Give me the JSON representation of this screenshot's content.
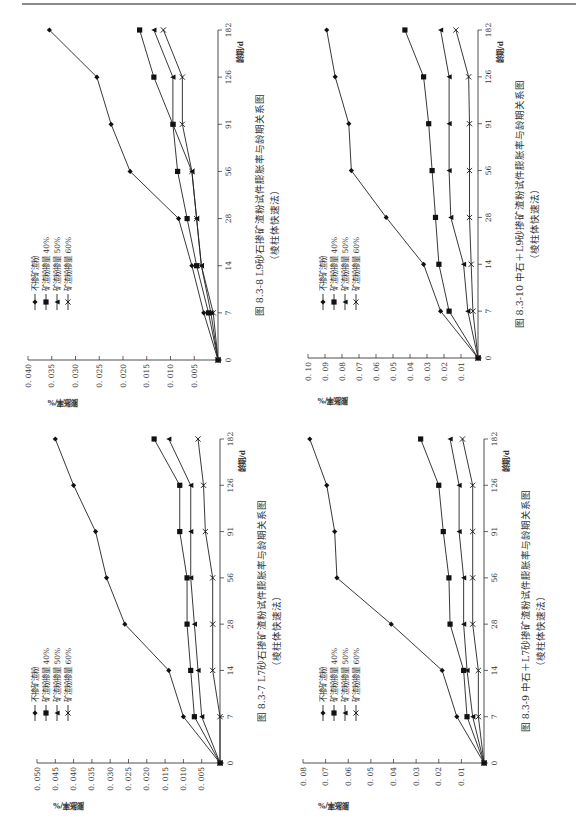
{
  "page": {
    "top_rule": true
  },
  "chart_data": [
    {
      "id": "fig-8.3-8",
      "type": "line",
      "title": "图 8.3-8  L9砂石掺矿渣粉试件膨胀率与龄期关系图",
      "subtitle": "（棱柱体快速法）",
      "xlabel": "龄期/d",
      "ylabel": "膨胀率/%",
      "x": [
        0,
        7,
        14,
        28,
        56,
        91,
        126,
        182
      ],
      "x_tick_labels": [
        "0",
        "7",
        "14",
        "28",
        "56",
        "91",
        "126",
        "182"
      ],
      "ylim": [
        0,
        0.04
      ],
      "y_ticks": [
        "0.005",
        "0.010",
        "0.015",
        "0.020",
        "0.025",
        "0.030",
        "0.035",
        "0.040"
      ],
      "grid": false,
      "legend_position": "upper-left (rotated)",
      "series": [
        {
          "name": "不掺矿渣粉",
          "marker": "diamond",
          "values": [
            0,
            0.003,
            0.0055,
            0.0083,
            0.0185,
            0.0225,
            0.0255,
            0.0355
          ]
        },
        {
          "name": "矿渣粉掺量 40%",
          "marker": "square",
          "values": [
            0,
            0.002,
            0.0045,
            0.0065,
            0.0085,
            0.0095,
            0.0135,
            0.0165
          ]
        },
        {
          "name": "矿渣粉掺量 50%",
          "marker": "triangle",
          "values": [
            0,
            0.0015,
            0.0035,
            0.0045,
            0.0055,
            0.0095,
            0.0095,
            0.0135
          ]
        },
        {
          "name": "矿渣粉掺量 60%",
          "marker": "x",
          "values": [
            0,
            0.001,
            0.0035,
            0.0045,
            0.0055,
            0.0075,
            0.0075,
            0.0115
          ]
        }
      ]
    },
    {
      "id": "fig-8.3-10",
      "type": "line",
      "title": "图 8.3-10  中石＋L9砂掺矿渣粉试件膨胀率与龄期关系图",
      "subtitle": "（棱柱体快速法）",
      "xlabel": "龄期/d",
      "ylabel": "膨胀率/%",
      "x": [
        0,
        7,
        14,
        28,
        56,
        91,
        126,
        182
      ],
      "x_tick_labels": [
        "0",
        "7",
        "14",
        "28",
        "56",
        "91",
        "126",
        "182"
      ],
      "ylim": [
        0,
        0.1
      ],
      "y_ticks": [
        "0.01",
        "0.02",
        "0.03",
        "0.04",
        "0.05",
        "0.06",
        "0.07",
        "0.08",
        "0.09",
        "0.10"
      ],
      "grid": false,
      "legend_position": "upper-left (rotated)",
      "series": [
        {
          "name": "不掺矿渣粉",
          "marker": "diamond",
          "values": [
            0,
            0.022,
            0.032,
            0.054,
            0.0745,
            0.076,
            0.084,
            0.089
          ]
        },
        {
          "name": "矿渣粉掺量 40%",
          "marker": "square",
          "values": [
            0,
            0.017,
            0.023,
            0.025,
            0.027,
            0.029,
            0.032,
            0.043
          ]
        },
        {
          "name": "矿渣粉掺量 50%",
          "marker": "triangle",
          "values": [
            0,
            0.006,
            0.0085,
            0.016,
            0.017,
            0.017,
            0.017,
            0.022
          ]
        },
        {
          "name": "矿渣粉掺量 60%",
          "marker": "x",
          "values": [
            0,
            0.003,
            0.004,
            0.005,
            0.005,
            0.005,
            0.0055,
            0.013
          ]
        }
      ]
    },
    {
      "id": "fig-8.3-7",
      "type": "line",
      "title": "图 8.3-7  L7砂石掺矿渣粉试件膨胀率与龄期关系图",
      "subtitle": "（棱柱体快速法）",
      "xlabel": "龄期/d",
      "ylabel": "膨胀率/%",
      "x": [
        0,
        7,
        14,
        28,
        56,
        91,
        126,
        182
      ],
      "x_tick_labels": [
        "0",
        "7",
        "14",
        "28",
        "56",
        "91",
        "126",
        "182"
      ],
      "ylim": [
        0,
        0.05
      ],
      "y_ticks": [
        "0.005",
        "0.010",
        "0.015",
        "0.020",
        "0.025",
        "0.030",
        "0.035",
        "0.040",
        "0.045",
        "0.050"
      ],
      "grid": false,
      "legend_position": "upper-left (rotated)",
      "series": [
        {
          "name": "不掺矿渣粉",
          "marker": "diamond",
          "values": [
            0,
            0.01,
            0.014,
            0.026,
            0.031,
            0.034,
            0.04,
            0.045
          ]
        },
        {
          "name": "矿渣粉掺量 40%",
          "marker": "square",
          "values": [
            0,
            0.007,
            0.008,
            0.009,
            0.009,
            0.011,
            0.011,
            0.018
          ]
        },
        {
          "name": "矿渣粉掺量 50%",
          "marker": "triangle",
          "values": [
            0,
            0.005,
            0.006,
            0.007,
            0.008,
            0.008,
            0.008,
            0.014
          ]
        },
        {
          "name": "矿渣粉掺量 60%",
          "marker": "x",
          "values": [
            0,
            0.0,
            0.002,
            0.002,
            0.002,
            0.004,
            0.0045,
            0.006
          ]
        }
      ]
    },
    {
      "id": "fig-8.3-9",
      "type": "line",
      "title": "图 8.3-9  中石＋L7砂掺矿渣粉试件膨胀率与龄期关系图",
      "subtitle": "（棱柱体快速法）",
      "xlabel": "龄期/d",
      "ylabel": "膨胀率/%",
      "x": [
        0,
        7,
        14,
        28,
        56,
        91,
        126,
        182
      ],
      "x_tick_labels": [
        "0",
        "7",
        "14",
        "28",
        "56",
        "91",
        "126",
        "182"
      ],
      "ylim": [
        0,
        0.08
      ],
      "y_ticks": [
        "0.01",
        "0.02",
        "0.03",
        "0.04",
        "0.05",
        "0.06",
        "0.07",
        "0.08"
      ],
      "grid": false,
      "legend_position": "upper-left (rotated)",
      "series": [
        {
          "name": "不掺矿渣粉",
          "marker": "diamond",
          "values": [
            0,
            0.012,
            0.0185,
            0.041,
            0.065,
            0.066,
            0.0695,
            0.077
          ]
        },
        {
          "name": "矿渣粉掺量 40%",
          "marker": "square",
          "values": [
            0,
            0.0075,
            0.009,
            0.015,
            0.0155,
            0.018,
            0.02,
            0.028
          ]
        },
        {
          "name": "矿渣粉掺量 50%",
          "marker": "triangle",
          "values": [
            0,
            0.005,
            0.0075,
            0.009,
            0.009,
            0.011,
            0.011,
            0.015
          ]
        },
        {
          "name": "矿渣粉掺量 60%",
          "marker": "x",
          "values": [
            0,
            0.0025,
            0.0025,
            0.005,
            0.005,
            0.005,
            0.005,
            0.0095
          ]
        }
      ]
    }
  ],
  "panels": [
    {
      "caption_line1": "图 8.3-8   L9砂石掺矿渣粉试件膨胀率与龄期关系图",
      "caption_line2": "（棱柱体快速法）"
    },
    {
      "caption_line1": "图 8.3-10   中石＋L9砂掺矿渣粉试件膨胀率与龄期关系图",
      "caption_line2": "（棱柱体快速法）"
    },
    {
      "caption_line1": "图 8.3-7   L7砂石掺矿渣粉试件膨胀率与龄期关系图",
      "caption_line2": "（棱柱体快速法）"
    },
    {
      "caption_line1": "图 8.3-9   中石＋L7砂掺矿渣粉试件膨胀率与龄期关系图",
      "caption_line2": "（棱柱体快速法）"
    }
  ]
}
